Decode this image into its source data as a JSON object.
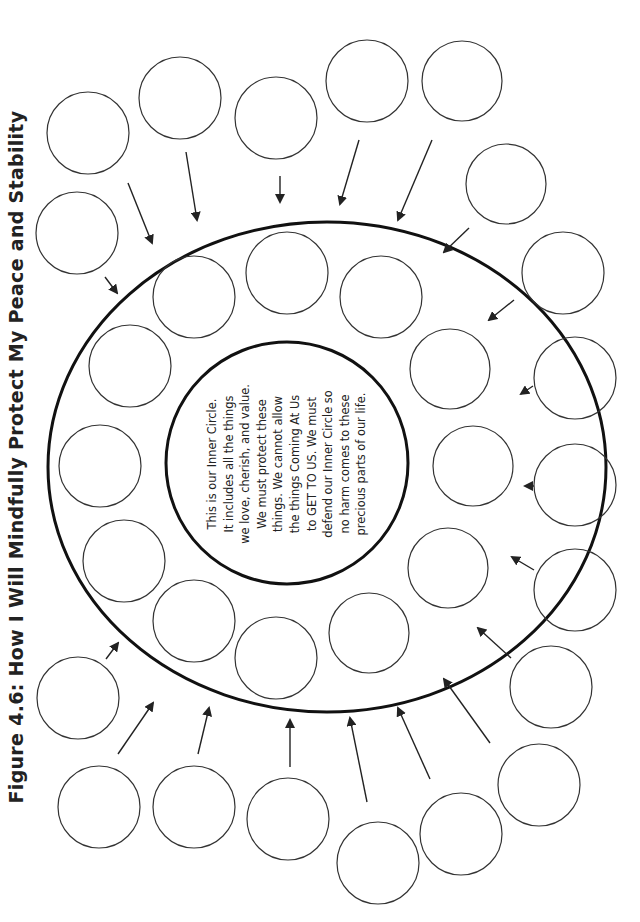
{
  "title": "Figure 4.6:  How I Will Mindfully Protect My Peace and Stability",
  "inner_circle": {
    "lines": [
      "This is our Inner Circle.",
      "It includes all the things",
      "we love, cherish, and value.",
      "We must protect these",
      "things.  We cannot allow",
      "the things Coming At Us",
      "to GET TO US.  We must",
      "defend our Inner Circle so",
      "no harm comes to these",
      "precious parts of our life."
    ]
  },
  "colors": {
    "stroke": "#222222",
    "background": "#ffffff"
  },
  "counts": {
    "inner_ring_blank_circles": 14,
    "outer_blank_circles": 19,
    "arrows": 19
  }
}
